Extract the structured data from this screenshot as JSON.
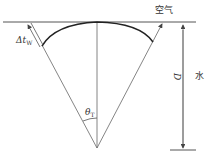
{
  "labels": {
    "air": "空气",
    "water": "水",
    "depth": "D",
    "delta_tw_main": "Δt",
    "delta_tw_sub": "W",
    "theta_main": "θ",
    "theta_sub": "T"
  },
  "colors": {
    "line": "#555555",
    "arc": "#222222",
    "text": "#333333"
  }
}
